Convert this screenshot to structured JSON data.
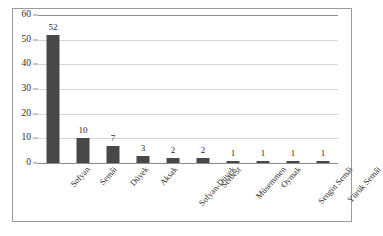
{
  "chart_data": {
    "type": "bar",
    "title": "",
    "subtitle": "",
    "xlabel": "",
    "ylabel": "",
    "categories": [
      "Sofyan",
      "Semâi",
      "Düyek",
      "Aksak",
      "Sofyan-Düyek",
      "Serbest",
      "Müsemmen",
      "Oymak",
      "Sengin Semâi",
      "Yürük Semâi"
    ],
    "values": [
      52,
      10,
      7,
      3,
      2,
      2,
      1,
      1,
      1,
      1
    ],
    "data_labels": [
      "52",
      "10",
      "7",
      "3",
      "2",
      "2",
      "1",
      "1",
      "1",
      "1"
    ],
    "ylim": [
      0,
      60
    ],
    "ytick_labels": [
      "0",
      "10",
      "20",
      "30",
      "40",
      "50",
      "60"
    ],
    "ytick_values": [
      0,
      10,
      20,
      30,
      40,
      50,
      60
    ],
    "grid": true,
    "grid_axis": "y",
    "legend": null,
    "legend_position": "none",
    "series": [
      {
        "name": "",
        "values": [
          52,
          10,
          7,
          3,
          2,
          2,
          1,
          1,
          1,
          1
        ]
      }
    ]
  },
  "style": {
    "bar_color": "#484848",
    "grid_color": "#d4d4d4",
    "axis_color": "#8c8c8c",
    "frame_color": "#9a9a9a",
    "text_color": "#2b2b2b",
    "background": "#ffffff"
  }
}
